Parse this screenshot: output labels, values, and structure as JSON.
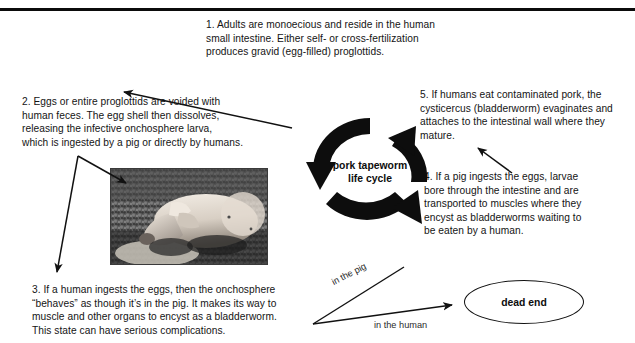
{
  "figure": {
    "title": "pork tapeworm life cycle",
    "cycle_label_line1": "pork tapeworm",
    "cycle_label_line2": "life cycle",
    "ink_color": "#111111",
    "background": "#ffffff"
  },
  "steps": {
    "step1": "1.  Adults are monoecious and reside in the human\nsmall intestine.  Either self- or cross-fertilization\nproduces gravid (egg-filled) proglottids.",
    "step2": "2.  Eggs or entire proglottids are voided with\nhuman feces.  The egg shell then dissolves,\nreleasing the infective onchosphere larva,\nwhich is ingested by a pig or directly by humans.",
    "step3": "3.  If a human ingests the eggs, then the onchosphere\n“behaves” as though it’s in the pig.  It makes its way to\nmuscle and other organs to encyst as a bladderworm.\nThis state can have serious complications.",
    "step4": "4.  If a pig ingests the eggs, larvae\nbore through the intestine and are\ntransported to muscles where they\nencyst as bladderworms waiting to\nbe eaten by a human.",
    "step5": "5.  If humans eat contaminated pork, the\ncysticercus (bladderworm) evaginates and\nattaches to the intestinal wall where they\nmature."
  },
  "nodes": {
    "dead_end": "dead end"
  },
  "edge_labels": {
    "in_the_pig": "in the pig",
    "in_the_human": "in the human"
  },
  "images": {
    "pig_photo_alt": "pig-photograph"
  }
}
